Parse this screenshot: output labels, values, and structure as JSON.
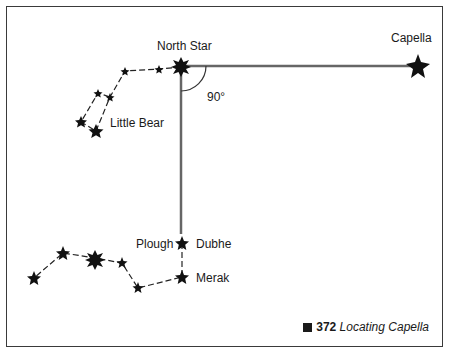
{
  "figure": {
    "number": "372",
    "title": "Locating Capella"
  },
  "labels": {
    "north_star": "North Star",
    "capella": "Capella",
    "little_bear": "Little Bear",
    "plough": "Plough",
    "dubhe": "Dubhe",
    "merak": "Merak",
    "angle": "90°"
  },
  "colors": {
    "ink": "#1a1a1a",
    "line": "#555555"
  }
}
